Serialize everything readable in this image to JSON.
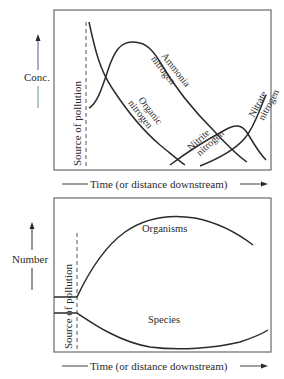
{
  "top_chart": {
    "y_axis_label": "Conc.",
    "x_axis_label": "Time (or distance downstream)",
    "source_label": "Source of pollution",
    "curves": [
      {
        "name": "organic-nitrogen",
        "label_line1": "Organic",
        "label_line2": "nitrogen"
      },
      {
        "name": "ammonia-nitrogen",
        "label_line1": "Ammonia",
        "label_line2": "nitrogen"
      },
      {
        "name": "nitrite-nitrogen",
        "label_line1": "Nitrite",
        "label_line2": "nitrogen"
      },
      {
        "name": "nitrate-nitrogen",
        "label_line1": "Nitrate",
        "label_line2": "nitrogen"
      }
    ]
  },
  "bottom_chart": {
    "y_axis_label": "Number",
    "x_axis_label": "Time (or distance downstream)",
    "source_label": "Source of pollution",
    "curves": [
      {
        "name": "organisms",
        "label": "Organisms"
      },
      {
        "name": "species",
        "label": "Species"
      }
    ]
  },
  "colors": {
    "line": "#2b2b2b",
    "frame": "#6a6a6a",
    "conc_arrow_upper": "#4a5aa8",
    "conc_arrow_lower": "#5a9a86"
  }
}
